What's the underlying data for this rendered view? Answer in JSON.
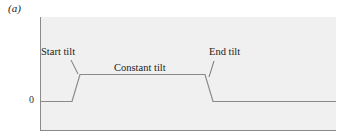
{
  "figure": {
    "panel_label": "(a)",
    "y_tick_zero": "0",
    "annotations": {
      "start": "Start tilt",
      "constant": "Constant tilt",
      "end": "End tilt"
    },
    "colors": {
      "background": "#f0f0f0",
      "axis": "#8a8a8a",
      "signal": "#8a8a8a"
    }
  }
}
